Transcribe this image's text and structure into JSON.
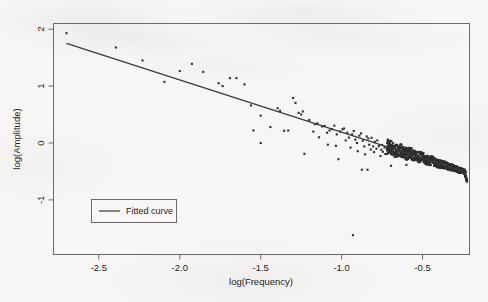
{
  "figure": {
    "background_color": "#f7f6f4",
    "ink_color": "#343434",
    "frame_color": "#6a6a6a"
  },
  "chart_data": {
    "type": "scatter",
    "title": "",
    "subtitle": "",
    "xlabel": "log(Frequency)",
    "ylabel": "log(Amplitude)",
    "xlim": [
      -2.78,
      -0.21
    ],
    "ylim": [
      -1.96,
      2.1
    ],
    "xticks": [
      -2.5,
      -2.0,
      -1.5,
      -1.0,
      -0.5
    ],
    "xticklabels": [
      "-2.5",
      "-2.0",
      "-1.5",
      "-1.0",
      "-0.5"
    ],
    "yticks": [
      2,
      1,
      0,
      -1
    ],
    "yticklabels": [
      "2",
      "1",
      "0",
      "-1"
    ],
    "grid": false,
    "legend": {
      "position": "lower-left",
      "entries": [
        {
          "label": "Fitted curve",
          "marker": "line",
          "color": "#3a3a3a"
        }
      ]
    },
    "series": [
      {
        "name": "Observations",
        "type": "scatter",
        "marker": "square",
        "marker_size": 2.1,
        "color": "#2e2e2e",
        "points": [
          [
            -2.7,
            1.93
          ],
          [
            -2.395,
            1.68
          ],
          [
            -2.23,
            1.45
          ],
          [
            -2.095,
            1.075
          ],
          [
            -2.0,
            1.265
          ],
          [
            -1.925,
            1.39
          ],
          [
            -1.855,
            1.25
          ],
          [
            -1.76,
            1.05
          ],
          [
            -1.735,
            1.0
          ],
          [
            -1.69,
            1.14
          ],
          [
            -1.65,
            1.14
          ],
          [
            -1.6,
            1.03
          ],
          [
            -1.56,
            0.66
          ],
          [
            -1.5,
            0.48
          ],
          [
            -1.5,
            0.0
          ],
          [
            -1.545,
            0.22
          ],
          [
            -1.44,
            0.28
          ],
          [
            -1.395,
            0.61
          ],
          [
            -1.38,
            0.565
          ],
          [
            -1.355,
            0.215
          ],
          [
            -1.33,
            0.22
          ],
          [
            -1.3,
            0.79
          ],
          [
            -1.285,
            0.705
          ],
          [
            -1.265,
            0.53
          ],
          [
            -1.25,
            0.5
          ],
          [
            -1.24,
            0.555
          ],
          [
            -1.23,
            -0.19
          ],
          [
            -1.2,
            0.405
          ],
          [
            -1.175,
            0.2
          ],
          [
            -1.165,
            0.33
          ],
          [
            -1.15,
            0.345
          ],
          [
            -1.14,
            0.1
          ],
          [
            -1.12,
            0.29
          ],
          [
            -1.105,
            0.3
          ],
          [
            -1.09,
            0.18
          ],
          [
            -1.085,
            -0.03
          ],
          [
            -1.075,
            0.22
          ],
          [
            -1.06,
            0.245
          ],
          [
            -1.045,
            0.305
          ],
          [
            -1.035,
            -0.05
          ],
          [
            -1.03,
            0.15
          ],
          [
            -1.02,
            -0.285
          ],
          [
            -1.01,
            0.2
          ],
          [
            -0.995,
            0.24
          ],
          [
            -0.985,
            0.255
          ],
          [
            -0.975,
            0.045
          ],
          [
            -0.965,
            0.18
          ],
          [
            -0.955,
            0.095
          ],
          [
            -0.945,
            -0.08
          ],
          [
            -0.935,
            0.15
          ],
          [
            -0.925,
            0.21
          ],
          [
            -0.915,
            0.06
          ],
          [
            -0.905,
            0.0
          ],
          [
            -0.9,
            -0.145
          ],
          [
            -0.89,
            0.13
          ],
          [
            -0.88,
            0.17
          ],
          [
            -0.875,
            -0.47
          ],
          [
            -0.87,
            0.04
          ],
          [
            -0.86,
            -0.06
          ],
          [
            -0.855,
            -0.2
          ],
          [
            -0.845,
            0.115
          ],
          [
            -0.84,
            -0.47
          ],
          [
            -0.835,
            0.08
          ],
          [
            -0.83,
            -0.03
          ],
          [
            -0.82,
            -0.115
          ],
          [
            -0.815,
            0.09
          ],
          [
            -0.805,
            -0.06
          ],
          [
            -0.8,
            -0.16
          ],
          [
            -0.795,
            0.02
          ],
          [
            -0.785,
            -0.1
          ],
          [
            -0.78,
            0.045
          ],
          [
            -0.77,
            -0.055
          ],
          [
            -0.76,
            -0.23
          ],
          [
            -0.755,
            -0.12
          ],
          [
            -0.75,
            -0.035
          ],
          [
            -0.745,
            -0.155
          ],
          [
            -0.735,
            -0.08
          ],
          [
            -0.73,
            -0.195
          ],
          [
            -0.72,
            -0.105
          ],
          [
            -0.715,
            -0.045
          ],
          [
            -0.705,
            -0.16
          ],
          [
            -0.7,
            -0.105
          ],
          [
            -0.695,
            -0.4
          ],
          [
            -0.69,
            -0.135
          ],
          [
            -0.68,
            -0.09
          ],
          [
            -0.675,
            -0.185
          ],
          [
            -0.665,
            -0.13
          ],
          [
            -0.66,
            -0.215
          ],
          [
            -0.65,
            -0.15
          ],
          [
            -0.645,
            -0.115
          ],
          [
            -0.64,
            -0.2
          ],
          [
            -0.63,
            -0.155
          ],
          [
            -0.625,
            -0.245
          ],
          [
            -0.615,
            -0.18
          ],
          [
            -0.61,
            -0.135
          ],
          [
            -0.6,
            -0.385
          ],
          [
            -0.595,
            -0.2
          ],
          [
            -0.59,
            -0.265
          ],
          [
            -0.58,
            -0.215
          ],
          [
            -0.575,
            -0.17
          ],
          [
            -0.93,
            -1.62
          ]
        ]
      },
      {
        "name": "Fitted curve",
        "type": "line",
        "color": "#3a3a3a",
        "x": [
          -2.7,
          -0.225
        ],
        "y": [
          1.75,
          -0.52
        ],
        "slope": -0.917,
        "intercept": -0.726
      }
    ]
  }
}
